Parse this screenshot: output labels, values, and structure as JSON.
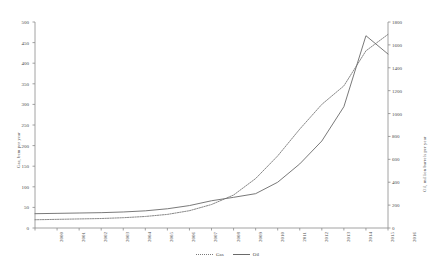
{
  "chart_data": {
    "type": "line",
    "title": "",
    "subtitle": "",
    "xlabel": "",
    "grid": false,
    "legend_position": "bottom",
    "x": [
      2000,
      2001,
      2002,
      2003,
      2004,
      2005,
      2006,
      2007,
      2008,
      2009,
      2010,
      2011,
      2012,
      2013,
      2014,
      2015,
      2016
    ],
    "xticklabels": [
      "2000",
      "2001",
      "2002",
      "2003",
      "2004",
      "2005",
      "2006",
      "2007",
      "2008",
      "2009",
      "2010",
      "2011",
      "2012",
      "2013",
      "2014",
      "2015",
      "2016"
    ],
    "axes": [
      {
        "id": "left",
        "label": "Gas, bcm per year",
        "ylim": [
          0,
          500
        ],
        "yticks": [
          0,
          50,
          100,
          150,
          200,
          250,
          300,
          350,
          400,
          450,
          500
        ],
        "yticklabels": [
          "0",
          "50",
          "100",
          "150",
          "200",
          "250",
          "300",
          "350",
          "400",
          "450",
          "500"
        ]
      },
      {
        "id": "right",
        "label": "Oil, million barrels per year",
        "ylim": [
          0,
          1800
        ],
        "yticks": [
          0,
          200,
          400,
          600,
          800,
          1000,
          1200,
          1400,
          1600,
          1800
        ],
        "yticklabels": [
          "0",
          "200",
          "400",
          "600",
          "800",
          "1000",
          "1200",
          "1400",
          "1600",
          "1800"
        ]
      }
    ],
    "series": [
      {
        "name": "Gas",
        "axis": "left",
        "style": "dotted",
        "color": "#7a7a7a",
        "values": [
          20,
          21,
          22,
          23,
          25,
          28,
          33,
          42,
          57,
          80,
          120,
          175,
          240,
          300,
          345,
          430,
          470
        ]
      },
      {
        "name": "Oil",
        "axis": "right",
        "style": "solid",
        "color": "#6a6a6a",
        "values": [
          125,
          128,
          131,
          134,
          140,
          150,
          168,
          196,
          238,
          268,
          300,
          400,
          560,
          760,
          1060,
          1680,
          1520
        ]
      }
    ]
  }
}
